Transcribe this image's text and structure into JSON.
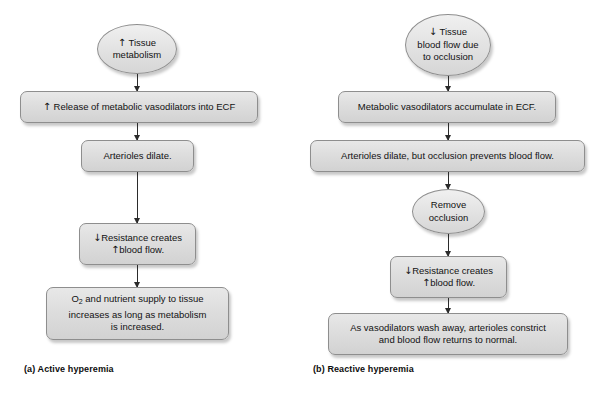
{
  "figure": {
    "background_color": "#ffffff",
    "node_fill_top": "#e8e8e8",
    "node_fill_bottom": "#d2d2d2",
    "node_border_color": "#8e8e8e",
    "connector_color": "#2b2b2b",
    "text_color": "#121212"
  },
  "panel_a": {
    "caption": "(a) Active hyperemia",
    "nodes": [
      {
        "id": "a1",
        "shape": "ellipse",
        "arrow": "up",
        "text": "Tissue\nmetabolism",
        "line1_prefix": "↑ ",
        "line1": "Tissue",
        "line2": "metabolism"
      },
      {
        "id": "a2",
        "shape": "box",
        "arrow": "up",
        "text": "↑ Release of metabolic vasodilators into ECF",
        "line1_prefix": "↑",
        "line1": " Release of metabolic vasodilators into ECF"
      },
      {
        "id": "a3",
        "shape": "box",
        "arrow": "none",
        "text": "Arterioles dilate."
      },
      {
        "id": "a4",
        "shape": "box",
        "arrow": "mixed",
        "line1_prefix": "↓",
        "line1": "Resistance creates",
        "line2_prefix": "↑",
        "line2": "blood flow.",
        "text": "↓Resistance creates ↑blood flow."
      },
      {
        "id": "a5",
        "shape": "box",
        "arrow": "none",
        "line1_a": "O",
        "line1_sub": "2",
        "line1_b": " and nutrient supply to tissue",
        "line2": "increases as long as metabolism",
        "line3": "is increased.",
        "text": "O2 and nutrient supply to tissue increases as long as metabolism is increased."
      }
    ]
  },
  "panel_b": {
    "caption": "(b) Reactive hyperemia",
    "nodes": [
      {
        "id": "b1",
        "shape": "ellipse",
        "arrow": "down",
        "line1_prefix": "↓ ",
        "line1": "Tissue",
        "line2": "blood flow due",
        "line3": "to occlusion",
        "text": "↓ Tissue blood flow due to occlusion"
      },
      {
        "id": "b2",
        "shape": "box",
        "arrow": "none",
        "text": "Metabolic vasodilators accumulate in ECF."
      },
      {
        "id": "b3",
        "shape": "box",
        "arrow": "none",
        "text": "Arterioles dilate, but occlusion prevents blood flow."
      },
      {
        "id": "b4",
        "shape": "ellipse",
        "arrow": "none",
        "line1": "Remove",
        "line2": "occlusion",
        "text": "Remove occlusion"
      },
      {
        "id": "b5",
        "shape": "box",
        "arrow": "mixed",
        "line1_prefix": "↓",
        "line1": "Resistance creates",
        "line2_prefix": "↑",
        "line2": "blood flow.",
        "text": "↓Resistance creates ↑blood flow."
      },
      {
        "id": "b6",
        "shape": "box",
        "arrow": "none",
        "line1": "As vasodilators wash away, arterioles constrict",
        "line2": "and blood flow returns to normal.",
        "text": "As vasodilators wash away, arterioles constrict and blood flow returns to normal."
      }
    ]
  },
  "glyphs": {
    "arrow_up": "↑",
    "arrow_down": "↓"
  }
}
